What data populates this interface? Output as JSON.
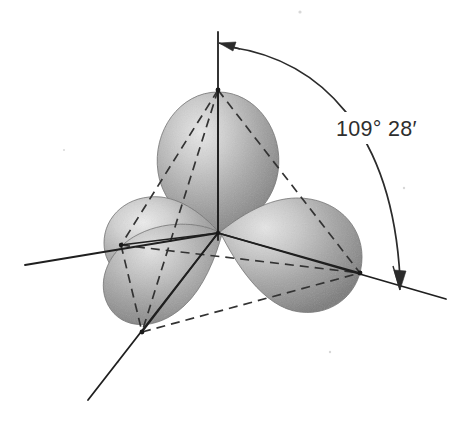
{
  "figure": {
    "name": "sp3-hybrid-orbitals-tetrahedral",
    "background_color": "#ffffff",
    "line_color": "#262626",
    "orbital_fill_dark": "#8f8f8f",
    "orbital_fill_mid": "#b0b0b0",
    "orbital_fill_light": "#e2e2e2",
    "orbital_edge": "#6f6f6f"
  },
  "annotations": {
    "bond_angle_label": "109° 28′",
    "bond_angle_degrees": 109,
    "bond_angle_minutes": 28
  },
  "geometry": {
    "center": {
      "x": 218,
      "y": 233
    },
    "vertices": [
      {
        "name": "top",
        "x": 218,
        "y": 90
      },
      {
        "name": "left",
        "x": 121,
        "y": 245
      },
      {
        "name": "bottom-left",
        "x": 142,
        "y": 332
      },
      {
        "name": "right",
        "x": 360,
        "y": 273
      }
    ],
    "axes": [
      {
        "name": "axis-vertical",
        "x1": 218,
        "y1": 32,
        "x2": 218,
        "y2": 240
      },
      {
        "name": "axis-left",
        "x1": 25,
        "y1": 265,
        "x2": 218,
        "y2": 233
      },
      {
        "name": "axis-bottom-left",
        "x1": 88,
        "y1": 400,
        "x2": 218,
        "y2": 233
      },
      {
        "name": "axis-right",
        "x1": 218,
        "y1": 233,
        "x2": 446,
        "y2": 299
      }
    ],
    "orbital_lobes": [
      {
        "name": "lobe-top",
        "direction": "up",
        "tip_x": 218,
        "tip_y": 233,
        "bulb_x": 218,
        "bulb_y": 130
      },
      {
        "name": "lobe-left",
        "direction": "up-left",
        "tip_x": 218,
        "tip_y": 233,
        "bulb_x": 142,
        "bulb_y": 233
      },
      {
        "name": "lobe-bottom-left",
        "direction": "down-left",
        "tip_x": 218,
        "tip_y": 233,
        "bulb_x": 163,
        "bulb_y": 300
      },
      {
        "name": "lobe-right",
        "direction": "right",
        "tip_x": 218,
        "tip_y": 233,
        "bulb_x": 310,
        "bulb_y": 262
      }
    ],
    "tetrahedron_edges": [
      {
        "from": "top",
        "to": "left"
      },
      {
        "from": "top",
        "to": "bottom-left"
      },
      {
        "from": "top",
        "to": "right"
      },
      {
        "from": "left",
        "to": "bottom-left"
      },
      {
        "from": "left",
        "to": "right"
      },
      {
        "from": "bottom-left",
        "to": "right"
      }
    ],
    "angle_arc": {
      "from_vertex": "top",
      "to_vertex": "right",
      "arrow_top": {
        "x": 228,
        "y": 46
      },
      "arrow_bottom": {
        "x": 400,
        "y": 285
      }
    }
  }
}
